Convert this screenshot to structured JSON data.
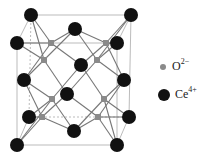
{
  "legend": {
    "oxygen": {
      "symbol": "O",
      "charge": "2−",
      "color": "#8a8a8a"
    },
    "cerium": {
      "symbol": "Ce",
      "charge": "4+",
      "color": "#111111"
    }
  },
  "structure": {
    "ce_atoms": [
      [
        31,
        15
      ],
      [
        131,
        15
      ],
      [
        75,
        29
      ],
      [
        17,
        43
      ],
      [
        117,
        43
      ],
      [
        81,
        65
      ],
      [
        24,
        80
      ],
      [
        124,
        80
      ],
      [
        67,
        94
      ],
      [
        29,
        117
      ],
      [
        129,
        117
      ],
      [
        74,
        131
      ],
      [
        17,
        145
      ],
      [
        117,
        145
      ]
    ],
    "o_atoms": [
      [
        51,
        43
      ],
      [
        106,
        43
      ],
      [
        44,
        60
      ],
      [
        97,
        60
      ],
      [
        52,
        99
      ],
      [
        104,
        99
      ],
      [
        42,
        117
      ],
      [
        98,
        117
      ]
    ]
  }
}
